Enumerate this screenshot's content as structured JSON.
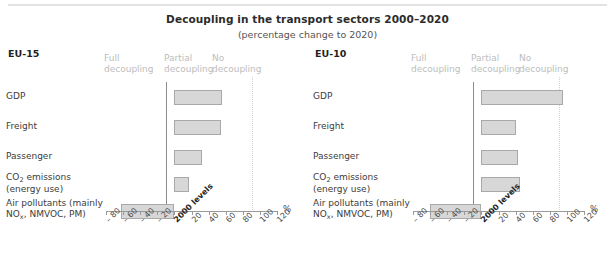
{
  "header": {
    "title": "Decoupling in the transport sectors 2000–2020",
    "subtitle": "(percentage change to 2020)"
  },
  "zones": {
    "full_line1": "Full",
    "full_line2": "decoupling",
    "partial_line1": "Partial",
    "partial_line2": "decoupling",
    "no_line1": "No",
    "no_line2": "decoupling"
  },
  "axis": {
    "unit": "%",
    "ticks": [
      "– 80",
      "– 60",
      "– 40",
      "– 20",
      "2000 levels",
      "20",
      "40",
      "60",
      "80",
      "100",
      "120"
    ],
    "tick_values": [
      -80,
      -60,
      -40,
      -20,
      0,
      20,
      40,
      60,
      80,
      100,
      120
    ],
    "zero_label": "2000 levels"
  },
  "panels": [
    {
      "name": "EU-15",
      "categories": [
        "GDP",
        "Freight",
        "Passenger",
        "CO2 emissions (energy use)",
        "Air pollutants (mainly NOx, NMVOC, PM)"
      ],
      "values": [
        56,
        54,
        32,
        17,
        -63
      ]
    },
    {
      "name": "EU-10",
      "categories": [
        "GDP",
        "Freight",
        "Passenger",
        "CO2 emissions (energy use)",
        "Air pollutants (mainly NOx, NMVOC, PM)"
      ],
      "values": [
        95,
        41,
        43,
        45,
        -60
      ]
    }
  ],
  "chart_data": {
    "type": "bar",
    "title": "Decoupling in the transport sectors 2000–2020",
    "subtitle": "(percentage change to 2020)",
    "orientation": "horizontal",
    "xlabel": "%",
    "ylabel": "",
    "xlim": [
      -80,
      120
    ],
    "xticks": [
      -80,
      -60,
      -40,
      -20,
      0,
      20,
      40,
      60,
      80,
      100,
      120
    ],
    "xticklabels": [
      "– 80",
      "– 60",
      "– 40",
      "– 20",
      "2000 levels",
      "20",
      "40",
      "60",
      "80",
      "100",
      "120"
    ],
    "grid": false,
    "legend": "none",
    "annotations": [
      "Full decoupling",
      "Partial decoupling",
      "No decoupling"
    ],
    "reference_lines": [
      0,
      100
    ],
    "categories": [
      "GDP",
      "Freight",
      "Passenger",
      "CO2 emissions (energy use)",
      "Air pollutants (mainly NOx, NMVOC, PM)"
    ],
    "series": [
      {
        "name": "EU-15",
        "values": [
          56,
          54,
          32,
          17,
          -63
        ]
      },
      {
        "name": "EU-10",
        "values": [
          95,
          41,
          43,
          45,
          -60
        ]
      }
    ],
    "bar_color": "#d7d7d7",
    "bar_edge_color": "#a9a9a9"
  }
}
